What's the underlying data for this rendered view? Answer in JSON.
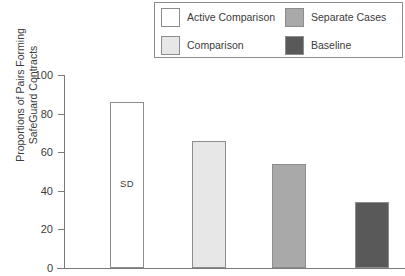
{
  "chart_data": {
    "type": "bar",
    "title": "",
    "subtitle": "",
    "xlabel": "",
    "ylabel": "Proportions of Pairs Forming\nSafeGuard Contracts",
    "ylim": [
      0,
      100
    ],
    "yticks": [
      0,
      20,
      40,
      60,
      80,
      100
    ],
    "ytick_labels": [
      "0",
      "20",
      "40",
      "60",
      "80",
      "100"
    ],
    "grid": false,
    "legend_position": "top",
    "categories": [
      "Active Comparison",
      "Comparison",
      "Separate Cases",
      "Baseline"
    ],
    "values": [
      86,
      66,
      54,
      34
    ],
    "bar_colors": [
      "#ffffff",
      "#e7e7e7",
      "#a9a9a9",
      "#595959"
    ],
    "bar_edge_color": "#8d8d8d",
    "annotations": [
      {
        "text": "SD",
        "series_index": 0,
        "note": "in-bar label on first bar"
      }
    ]
  },
  "legend": {
    "items": [
      {
        "label": "Active Comparison",
        "color": "#ffffff"
      },
      {
        "label": "Separate Cases",
        "color": "#a9a9a9"
      },
      {
        "label": "Comparison",
        "color": "#e7e7e7"
      },
      {
        "label": "Baseline",
        "color": "#595959"
      }
    ]
  },
  "axis": {
    "tick_color": "#7a7a7a",
    "line_color": "#7a7a7a"
  }
}
